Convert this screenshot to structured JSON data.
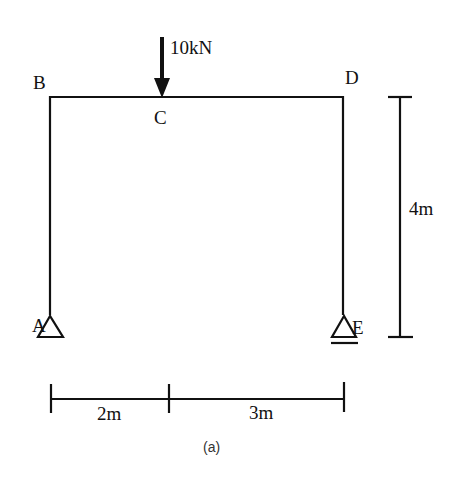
{
  "diagram": {
    "type": "portal-frame",
    "nodes": {
      "A": "A",
      "B": "B",
      "C": "C",
      "D": "D",
      "E": "E"
    },
    "load": {
      "label": "10kN",
      "at": "C",
      "direction": "down"
    },
    "dimensions": {
      "span_left": "2m",
      "span_right": "3m",
      "height": "4m"
    },
    "supports": {
      "A": "pin",
      "E": "roller"
    },
    "caption": "(a)"
  }
}
